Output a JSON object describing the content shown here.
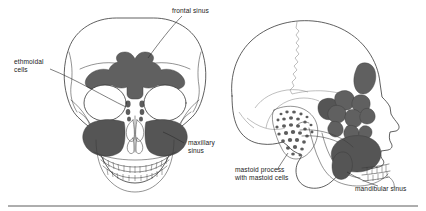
{
  "figure": {
    "background_color": "#ffffff",
    "ink_color": "#2b2b2b",
    "sinus_fill_color": "#5c5c5c",
    "views": [
      {
        "id": "anterior",
        "name": "Anterior view of skull",
        "position": "left"
      },
      {
        "id": "lateral",
        "name": "Lateral view of skull",
        "position": "right"
      }
    ]
  },
  "labels": {
    "frontal_sinus": "frontal sinus",
    "ethmoidal_cells_line1": "ethmoidal",
    "ethmoidal_cells_line2": "cells",
    "maxillary_sinus_line1": "maxillary",
    "maxillary_sinus_line2": "sinus",
    "mastoid_process_line1": "mastoid process",
    "mastoid_process_line2": "with mastoid cells",
    "mandibular_sinus": "mandibular sinus"
  },
  "structures": {
    "anterior": [
      "cranial-vault",
      "orbit-left",
      "orbit-right",
      "frontal-sinus",
      "ethmoidal-cells",
      "maxillary-sinus-left",
      "maxillary-sinus-right",
      "nasal-cavity",
      "nasal-turbinates",
      "upper-teeth",
      "lower-teeth",
      "mandible"
    ],
    "lateral": [
      "cranial-vault",
      "coronal-suture",
      "temporal-line",
      "mastoid-process",
      "mastoid-cells",
      "ethmoidal-cells",
      "frontal-sinus",
      "maxillary-sinus",
      "sphenoid-sinus",
      "mandible",
      "mandibular-sinus",
      "upper-teeth",
      "lower-teeth",
      "nasal-profile"
    ]
  }
}
